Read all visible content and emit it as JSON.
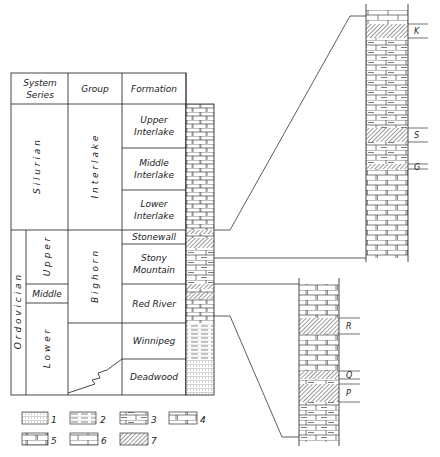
{
  "table": {
    "headers": {
      "system_series_1": "System",
      "system_series_2": "Series",
      "group": "Group",
      "formation": "Formation"
    },
    "systems": [
      {
        "name": "S i l u r i a n"
      },
      {
        "name": "O r d o v i c i a n"
      }
    ],
    "series": [
      {
        "name": "U p p e r"
      },
      {
        "name": "Middle"
      },
      {
        "name": "L o w e r"
      }
    ],
    "groups": [
      {
        "name": "I n t e r l a k e"
      },
      {
        "name": "B i g h o r n"
      }
    ],
    "formations": [
      {
        "line1": "Upper",
        "line2": "Interlake"
      },
      {
        "line1": "Middle",
        "line2": "Interlake"
      },
      {
        "line1": "Lower",
        "line2": "Interlake"
      },
      {
        "line1": "Stonewall",
        "line2": ""
      },
      {
        "line1": "Stony",
        "line2": "Mountain"
      },
      {
        "line1": "Red River",
        "line2": ""
      },
      {
        "line1": "Winnipeg",
        "line2": ""
      },
      {
        "line1": "Deadwood",
        "line2": ""
      }
    ]
  },
  "detail_markers": {
    "upper_column": [
      "K",
      "S",
      "G"
    ],
    "lower_column": [
      "R",
      "Q",
      "P"
    ]
  },
  "legend": [
    {
      "num": "1",
      "lithology": "sandstone"
    },
    {
      "num": "2",
      "lithology": "shale"
    },
    {
      "num": "3",
      "lithology": "argillaceous dolomite"
    },
    {
      "num": "4",
      "lithology": "dolomitic limestone"
    },
    {
      "num": "5",
      "lithology": "dolomite"
    },
    {
      "num": "6",
      "lithology": "limestone"
    },
    {
      "num": "7",
      "lithology": "hatched marker bed"
    }
  ],
  "colors": {
    "line": "#333333",
    "hatch": "#555555",
    "background": "#ffffff"
  }
}
